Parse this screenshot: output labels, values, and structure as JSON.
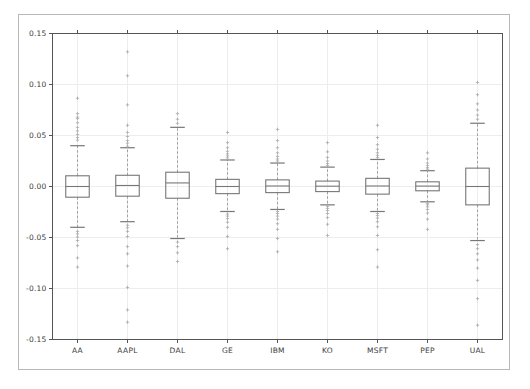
{
  "figure": {
    "background_color": "#ffffff",
    "frame_color": "#b8b8b8",
    "axes_color": "#555555",
    "grid_color": "#ededed",
    "box_edge_color": "#777777",
    "median_color": "#777777",
    "whisker_color": "#999999",
    "flier_color": "#aaaaaa"
  },
  "chart_data": {
    "type": "box",
    "title": "",
    "xlabel": "",
    "ylabel": "",
    "ylim": [
      -0.15,
      0.15
    ],
    "yticks": [
      0.15,
      0.1,
      0.05,
      0.0,
      -0.05,
      -0.1,
      -0.15
    ],
    "ytick_labels": [
      "0.15",
      "0.10",
      "0.05",
      "0.00",
      "-0.05",
      "-0.10",
      "-0.15"
    ],
    "grid": true,
    "grid_axis": "both",
    "legend": false,
    "categories": [
      "AA",
      "AAPL",
      "DAL",
      "GE",
      "IBM",
      "KO",
      "MSFT",
      "PEP",
      "UAL"
    ],
    "boxes": [
      {
        "label": "AA",
        "whisker_low": -0.04,
        "q1": -0.0105,
        "median": 0.0,
        "q3": 0.0105,
        "whisker_high": 0.04,
        "fliers": [
          0.0455,
          0.048,
          0.051,
          0.0545,
          0.058,
          0.0625,
          0.0665,
          0.068,
          0.0715,
          0.0865,
          -0.044,
          -0.0465,
          -0.0495,
          -0.053,
          -0.058,
          -0.07,
          -0.079
        ]
      },
      {
        "label": "AAPL",
        "whisker_low": -0.0345,
        "q1": -0.0095,
        "median": 0.001,
        "q3": 0.011,
        "whisker_high": 0.038,
        "fliers": [
          0.0395,
          0.0425,
          0.045,
          0.049,
          0.053,
          0.06,
          0.08,
          0.1085,
          0.132,
          -0.038,
          -0.0405,
          -0.044,
          -0.049,
          -0.059,
          -0.066,
          -0.078,
          -0.099,
          -0.121,
          -0.133
        ]
      },
      {
        "label": "DAL",
        "whisker_low": -0.051,
        "q1": -0.0115,
        "median": 0.0035,
        "q3": 0.014,
        "whisker_high": 0.058,
        "fliers": [
          0.062,
          0.066,
          0.0715,
          -0.0545,
          -0.059,
          -0.065,
          -0.0735
        ]
      },
      {
        "label": "GE",
        "whisker_low": -0.0245,
        "q1": -0.007,
        "median": 0.0,
        "q3": 0.007,
        "whisker_high": 0.026,
        "fliers": [
          0.028,
          0.03,
          0.032,
          0.0345,
          0.038,
          0.043,
          0.053,
          -0.027,
          -0.029,
          -0.0315,
          -0.035,
          -0.04,
          -0.049,
          -0.061
        ]
      },
      {
        "label": "IBM",
        "whisker_low": -0.0225,
        "q1": -0.006,
        "median": 0.0005,
        "q3": 0.0065,
        "whisker_high": 0.023,
        "fliers": [
          0.025,
          0.027,
          0.0295,
          0.033,
          0.038,
          0.045,
          0.056,
          -0.0245,
          -0.0265,
          -0.029,
          -0.032,
          -0.0365,
          -0.042,
          -0.051,
          -0.064
        ]
      },
      {
        "label": "KO",
        "whisker_low": -0.018,
        "q1": -0.005,
        "median": 0.0003,
        "q3": 0.0053,
        "whisker_high": 0.019,
        "fliers": [
          0.0205,
          0.0225,
          0.025,
          0.0285,
          0.034,
          0.043,
          -0.0195,
          -0.0215,
          -0.0235,
          -0.0265,
          -0.0305,
          -0.037,
          -0.048
        ]
      },
      {
        "label": "MSFT",
        "whisker_low": -0.0245,
        "q1": -0.0075,
        "median": 0.0005,
        "q3": 0.008,
        "whisker_high": 0.0265,
        "fliers": [
          0.0285,
          0.0305,
          0.033,
          0.0365,
          0.041,
          0.048,
          0.06,
          -0.0265,
          -0.0285,
          -0.031,
          -0.0345,
          -0.0395,
          -0.048,
          -0.062,
          -0.079
        ]
      },
      {
        "label": "PEP",
        "whisker_low": -0.015,
        "q1": -0.0042,
        "median": 0.0004,
        "q3": 0.0046,
        "whisker_high": 0.0155,
        "fliers": [
          0.017,
          0.0185,
          0.0205,
          0.023,
          0.027,
          0.033,
          -0.0165,
          -0.018,
          -0.02,
          -0.0225,
          -0.026,
          -0.032,
          -0.042
        ]
      },
      {
        "label": "UAL",
        "whisker_low": -0.053,
        "q1": -0.018,
        "median": 0.0,
        "q3": 0.018,
        "whisker_high": 0.062,
        "fliers": [
          0.066,
          0.07,
          0.075,
          0.081,
          0.09,
          0.102,
          -0.057,
          -0.061,
          -0.066,
          -0.072,
          -0.08,
          -0.092,
          -0.11,
          -0.136
        ]
      }
    ]
  }
}
